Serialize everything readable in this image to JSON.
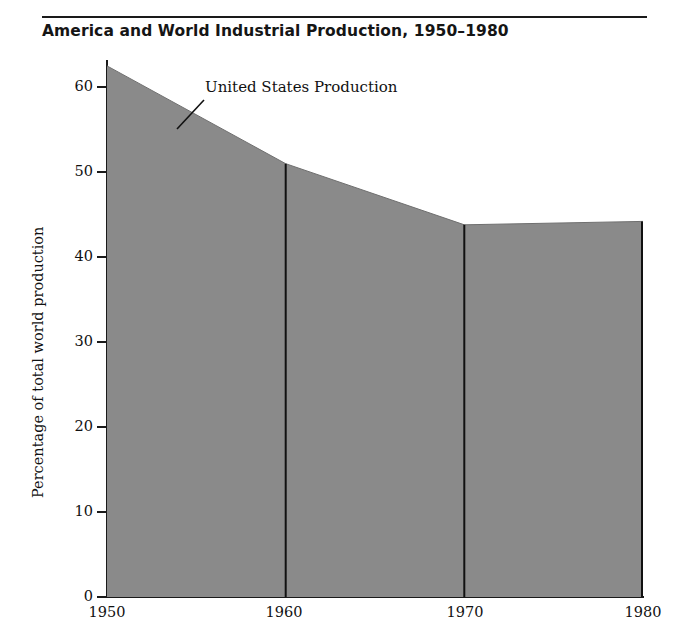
{
  "figure": {
    "title": "America and World Industrial Production, 1950–1980",
    "rule_color": "#1a1a1a",
    "background": "#ffffff"
  },
  "chart_data": {
    "type": "area",
    "title": "America and World Industrial Production, 1950–1980",
    "xlabel": "",
    "ylabel": "Percentage of total world production",
    "x": [
      1950,
      1960,
      1970,
      1980
    ],
    "xticklabels": [
      "1950",
      "1960",
      "1970",
      "1980"
    ],
    "yticks": [
      0,
      10,
      20,
      30,
      40,
      50,
      60
    ],
    "yticklabels": [
      "0",
      "10",
      "20",
      "30",
      "40",
      "50",
      "60"
    ],
    "xlim": [
      1950,
      1980
    ],
    "ylim": [
      0,
      63.2
    ],
    "grid": false,
    "legend": "none",
    "series": [
      {
        "name": "United States Production",
        "values": [
          62.5,
          51.0,
          43.8,
          44.2
        ],
        "fill_color": "#8a8a8a",
        "line_color": "#1a1a1a"
      }
    ],
    "annotations": [
      {
        "text": "United States Production",
        "target_x": 1954.0,
        "target_y": 55.2,
        "leader": true
      }
    ],
    "dividers": [
      1960,
      1970
    ],
    "divider_color": "#111111"
  },
  "axes": {
    "y_title": "Percentage of total world production",
    "y_ticks": [
      "60",
      "50",
      "40",
      "30",
      "20",
      "10",
      "0"
    ],
    "x_ticks": [
      "1950",
      "1960",
      "1970",
      "1980"
    ]
  },
  "annotation": {
    "label": "United States Production"
  }
}
